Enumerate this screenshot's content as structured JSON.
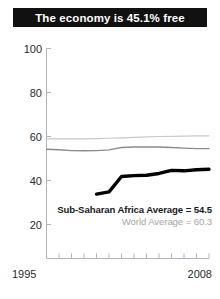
{
  "title": "The economy is 45.1% free",
  "chart_data": {
    "type": "line",
    "title": "The economy is 45.1% free",
    "xlabel": "",
    "ylabel": "",
    "xlim": [
      1995,
      2008
    ],
    "ylim": [
      0,
      100
    ],
    "grid": false,
    "legend_position": "inside-bottom-right",
    "yticks": [
      100,
      80,
      60,
      40,
      20
    ],
    "ytick_labels": [
      "100",
      "80",
      "60",
      "40",
      "20"
    ],
    "xticks": [
      1995,
      1996,
      1997,
      1998,
      1999,
      2000,
      2001,
      2002,
      2003,
      2004,
      2005,
      2006,
      2007,
      2008
    ],
    "xtick_labels": [
      "1995",
      "2008"
    ],
    "x": [
      1995,
      1996,
      1997,
      1998,
      1999,
      2000,
      2001,
      2002,
      2003,
      2004,
      2005,
      2006,
      2007,
      2008
    ],
    "series": [
      {
        "name": "World Average",
        "label": "World Average = 60.3",
        "color": "#c9c9c9",
        "width": 1.2,
        "values": [
          58.9,
          58.9,
          58.9,
          58.9,
          59.0,
          59.2,
          59.4,
          59.6,
          59.8,
          60.0,
          60.1,
          60.2,
          60.3,
          60.3
        ]
      },
      {
        "name": "Sub-Saharan Africa Average",
        "label": "Sub-Saharan Africa Average = 54.5",
        "color": "#8c8c8c",
        "width": 1.4,
        "values": [
          54.2,
          54.0,
          53.6,
          53.5,
          53.6,
          53.9,
          55.0,
          55.2,
          55.2,
          55.2,
          55.0,
          54.7,
          54.5,
          54.5
        ]
      },
      {
        "name": "Country",
        "label": "The economy is 45.1% free",
        "color": "#000000",
        "width": 3.4,
        "values": [
          null,
          null,
          null,
          null,
          33.8,
          34.8,
          41.8,
          42.2,
          42.4,
          43.2,
          44.6,
          44.4,
          44.9,
          45.1
        ]
      }
    ],
    "final_value": 45.1,
    "annotations": [
      {
        "text": "Sub-Saharan Africa Average = 54.5",
        "color": "#1a1a1a",
        "bold": true
      },
      {
        "text": "World Average = 60.3",
        "color": "#a6a6a6",
        "bold": false
      }
    ]
  },
  "axis": {
    "y_labels": [
      {
        "value": "100"
      },
      {
        "value": "80"
      },
      {
        "value": "60"
      },
      {
        "value": "40"
      },
      {
        "value": "20"
      }
    ],
    "x_start": "1995",
    "x_end": "2008"
  },
  "legend": {
    "primary": "Sub-Saharan Africa Average = 54.5",
    "secondary": "World Average = 60.3"
  },
  "colors": {
    "title_bg": "#111111",
    "title_fg": "#ffffff",
    "axis": "#b5b5b5",
    "country_line": "#000000",
    "region_line": "#8c8c8c",
    "world_line": "#c9c9c9"
  }
}
